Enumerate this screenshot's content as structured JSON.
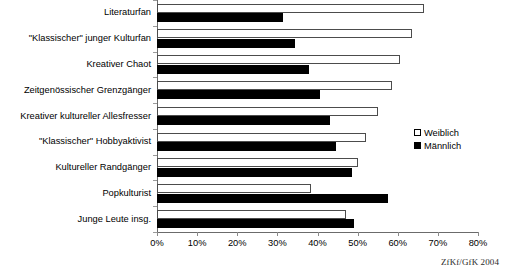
{
  "chart_data": {
    "type": "bar",
    "orientation": "horizontal",
    "title": "",
    "subtitle": "",
    "xlabel": "",
    "ylabel": "",
    "xlim": [
      0,
      80
    ],
    "xticks": [
      "0%",
      "10%",
      "20%",
      "30%",
      "40%",
      "50%",
      "60%",
      "70%",
      "80%"
    ],
    "xtick_values": [
      0,
      10,
      20,
      30,
      40,
      50,
      60,
      70,
      80
    ],
    "grid": false,
    "legend_position": "right",
    "categories": [
      "Literaturfan",
      "\"Klassischer\" junger Kulturfan",
      "Kreativer Chaot",
      "Zeitgenössischer Grenzgänger",
      "Kreativer kultureller Allesfresser",
      "\"Klassischer\" Hobbyaktivist",
      "Kultureller  Randgänger",
      "Popkulturist",
      "Junge Leute insg."
    ],
    "series": [
      {
        "name": "Weiblich",
        "color": "#ffffff",
        "edge_color": "#4c4c4c",
        "values": [
          66.5,
          63.5,
          60.5,
          58.5,
          55.0,
          52.0,
          50.0,
          38.5,
          47.0
        ]
      },
      {
        "name": "Männlich",
        "color": "#000000",
        "edge_color": "#000000",
        "values": [
          31.5,
          34.5,
          38.0,
          40.5,
          43.0,
          44.5,
          48.5,
          57.5,
          49.0
        ]
      }
    ],
    "source_note": "ZfKf/GfK 2004"
  },
  "legend": {
    "items": [
      {
        "label": "Weiblich"
      },
      {
        "label": "Männlich"
      }
    ]
  },
  "footer": {
    "source": "ZfKf/GfK 2004"
  }
}
